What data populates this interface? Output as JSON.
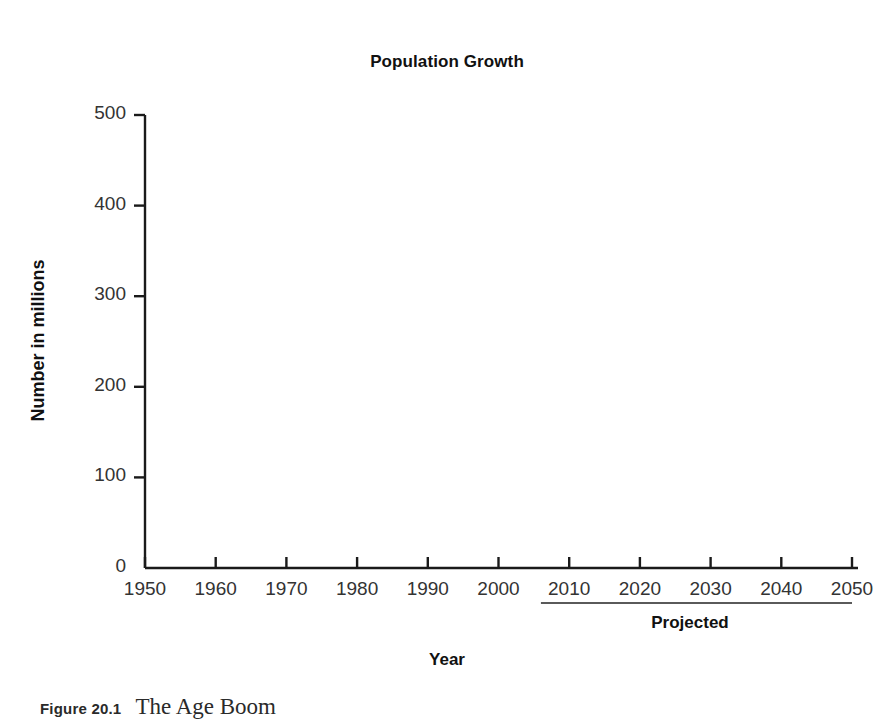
{
  "figure": {
    "caption_number": "Figure 20.1",
    "caption_title": "The Age Boom"
  },
  "chart_data": {
    "type": "line",
    "title": "Population Growth",
    "xlabel": "Year",
    "ylabel": "Number in millions",
    "xlim": [
      1950,
      2050
    ],
    "ylim": [
      0,
      500
    ],
    "grid": false,
    "legend_position": "center-right",
    "x_ticks": [
      "1950",
      "1960",
      "1970",
      "1980",
      "1990",
      "2000",
      "2010",
      "2020",
      "2030",
      "2040",
      "2050"
    ],
    "y_ticks": [
      "0",
      "100",
      "200",
      "300",
      "400",
      "500"
    ],
    "x": [
      1950,
      1960,
      1970,
      1980,
      1990,
      2000,
      2005,
      2010,
      2020,
      2030,
      2040,
      2050
    ],
    "projection_start_year": 2008,
    "annotations": [
      {
        "name": "projected-bracket",
        "label": "Projected",
        "from_year": 2006,
        "to_year": 2050
      }
    ],
    "series": [
      {
        "name": "Total population",
        "color": "#c9c9c9",
        "values": [
          152,
          181,
          205,
          228,
          250,
          282,
          300,
          310,
          336,
          364,
          392,
          420
        ]
      },
      {
        "name": "65 years and over",
        "color": "#595959",
        "values": [
          12,
          17,
          20,
          26,
          31,
          35,
          37,
          40,
          55,
          72,
          82,
          90
        ]
      },
      {
        "name": "65-74 years",
        "color": "#8a8a8a",
        "values": [
          8,
          11,
          12,
          15,
          18,
          18,
          19,
          21,
          32,
          38,
          40,
          50
        ]
      },
      {
        "name": "75+ years",
        "color": "#a0a0a0",
        "values": [
          4,
          6,
          8,
          10,
          13,
          16,
          18,
          19,
          23,
          33,
          42,
          42
        ]
      }
    ]
  },
  "legend": {
    "items": [
      {
        "label": "Total population",
        "color": "#c9c9c9"
      },
      {
        "label": "65 years and over",
        "color": "#595959"
      },
      {
        "label": "65-74 years",
        "color": "#8a8a8a"
      },
      {
        "label": "75+ years",
        "color": "#a0a0a0"
      }
    ]
  }
}
